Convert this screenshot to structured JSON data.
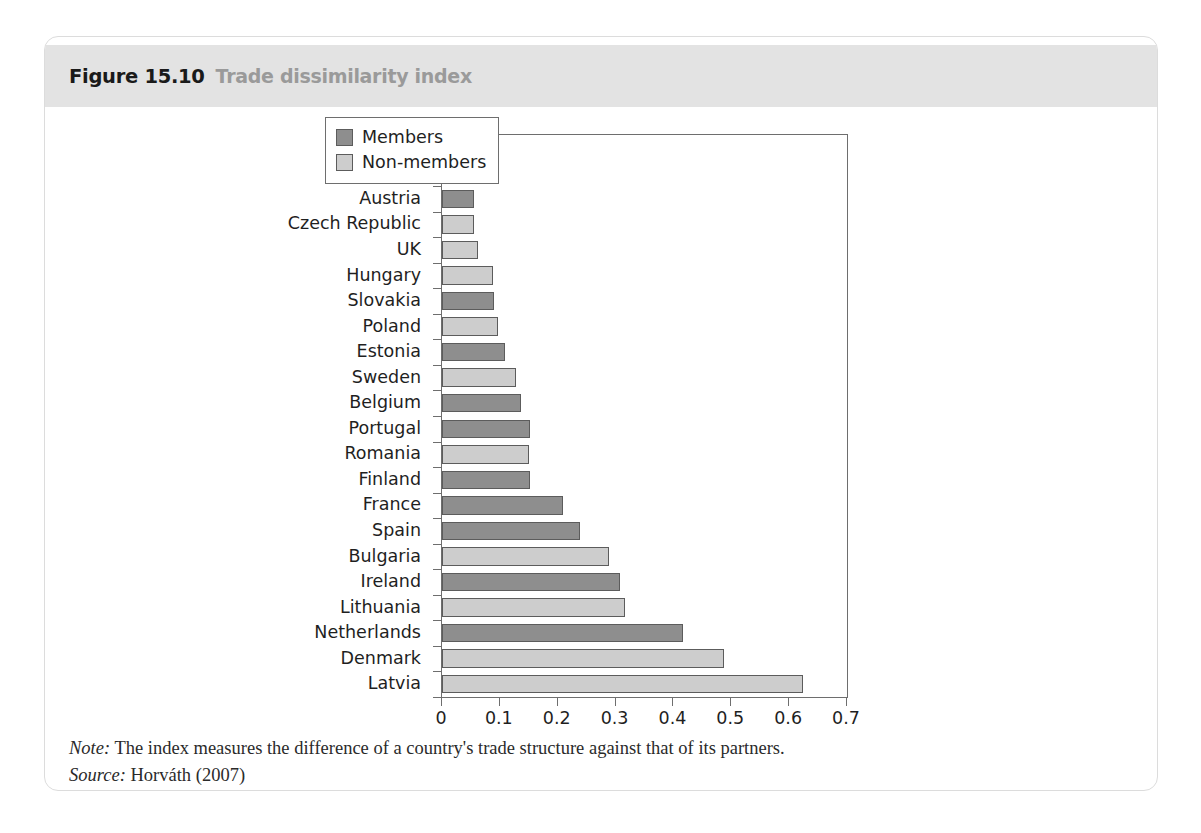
{
  "figure": {
    "number": "Figure 15.10",
    "title": "Trade dissimilarity index"
  },
  "legend": {
    "position": "top-right-inside",
    "items": [
      {
        "label": "Members",
        "color": "#8e8e8e",
        "key": "members"
      },
      {
        "label": "Non-members",
        "color": "#cdcdcd",
        "key": "nonmembers"
      }
    ]
  },
  "footnotes": {
    "note_key": "Note:",
    "note_text": "The index measures the difference of a country's trade structure against that of its partners.",
    "source_key": "Source:",
    "source_text": "Horváth (2007)"
  },
  "chart_data": {
    "type": "bar",
    "orientation": "horizontal",
    "title": "Trade dissimilarity index",
    "xlabel": "",
    "ylabel": "",
    "xlim": [
      0,
      0.7
    ],
    "xticks": [
      "0",
      "0.1",
      "0.2",
      "0.3",
      "0.4",
      "0.5",
      "0.6",
      "0.7"
    ],
    "xtick_values": [
      0,
      0.1,
      0.2,
      0.3,
      0.4,
      0.5,
      0.6,
      0.7
    ],
    "grid": false,
    "categories": [
      "Slovenia",
      "Italy",
      "Austria",
      "Czech Republic",
      "UK",
      "Hungary",
      "Slovakia",
      "Poland",
      "Estonia",
      "Sweden",
      "Belgium",
      "Portugal",
      "Romania",
      "Finland",
      "France",
      "Spain",
      "Bulgaria",
      "Ireland",
      "Lithuania",
      "Netherlands",
      "Denmark",
      "Latvia"
    ],
    "values": [
      0.024,
      0.043,
      0.055,
      0.056,
      0.062,
      0.089,
      0.09,
      0.096,
      0.109,
      0.128,
      0.136,
      0.152,
      0.15,
      0.152,
      0.209,
      0.238,
      0.289,
      0.307,
      0.317,
      0.417,
      0.488,
      0.624
    ],
    "groups": [
      "members",
      "members",
      "members",
      "nonmembers",
      "nonmembers",
      "nonmembers",
      "members",
      "nonmembers",
      "members",
      "nonmembers",
      "members",
      "members",
      "nonmembers",
      "members",
      "members",
      "members",
      "nonmembers",
      "members",
      "nonmembers",
      "members",
      "nonmembers",
      "nonmembers"
    ],
    "series": [
      {
        "name": "Members",
        "color": "#8e8e8e"
      },
      {
        "name": "Non-members",
        "color": "#cdcdcd"
      }
    ]
  }
}
